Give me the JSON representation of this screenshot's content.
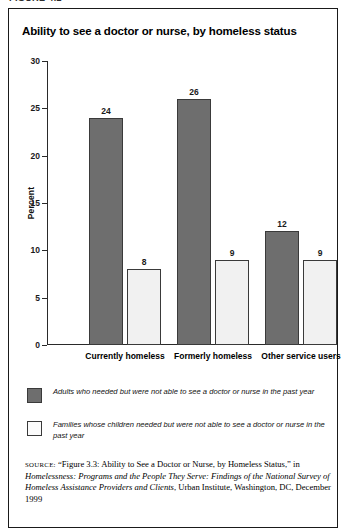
{
  "figure_caption": "FIGURE 4.2",
  "chart_data": {
    "type": "bar",
    "title": "Ability to see a doctor or nurse, by homeless status",
    "xlabel": "",
    "ylabel": "Percent",
    "ylim": [
      0,
      30
    ],
    "yticks": [
      0,
      5,
      10,
      15,
      20,
      25,
      30
    ],
    "ytick_labels": [
      "0",
      "5",
      "10",
      "15",
      "20",
      "25",
      "30"
    ],
    "grid": false,
    "legend_position": "below",
    "categories": [
      "Currently homeless",
      "Formerly homeless",
      "Other service users"
    ],
    "series": [
      {
        "name": "Adults who needed but were not able to see a doctor or nurse in the past year",
        "values": [
          24,
          26,
          12
        ],
        "color": "#6e6e6e"
      },
      {
        "name": "Families whose children needed but were not able to see a doctor or nurse in the past year",
        "values": [
          8,
          9,
          9
        ],
        "color": "#f1f1f1"
      }
    ]
  },
  "legend": {
    "items": [
      {
        "swatch": "dark",
        "label": "Adults who needed but were not able to see a doctor or nurse in the past year"
      },
      {
        "swatch": "light",
        "label": "Families whose children needed but were not able to see a doctor or nurse in the past year"
      }
    ]
  },
  "source": {
    "kicker": "SOURCE:",
    "part1": "“Figure 3.3: Ability to See a Doctor or Nurse, by Homeless Status,” in ",
    "title_italic": "Homelessness: Programs and the People They Serve: Findings of the National Survey of Homeless Assistance Providers and Clients",
    "part2": ", Urban Institute,  Washington, DC, December 1999"
  },
  "colors": {
    "dark_bar": "#6e6e6e",
    "light_bar": "#f1f1f1",
    "outline": "#3a3a3a",
    "frame": "#1a1a1a"
  }
}
